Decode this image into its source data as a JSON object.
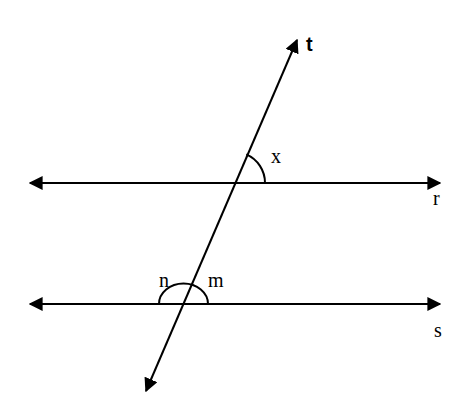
{
  "diagram": {
    "title": "",
    "lines": [
      {
        "id": "r",
        "label": "r",
        "kind": "horizontal",
        "y": 183,
        "x1": 28,
        "x2": 440,
        "arrows": "both"
      },
      {
        "id": "s",
        "label": "s",
        "kind": "horizontal",
        "y": 304,
        "x1": 28,
        "x2": 440,
        "arrows": "both"
      },
      {
        "id": "t",
        "label": "t",
        "kind": "transversal",
        "x1": 298,
        "y1": 38,
        "x2": 145,
        "y2": 392,
        "arrows": "both"
      }
    ],
    "angles": [
      {
        "id": "x",
        "label": "x",
        "at_line": "r",
        "position": "upper-right of intersection of t and r"
      },
      {
        "id": "n",
        "label": "n",
        "at_line": "s",
        "position": "upper-left of intersection of t and s"
      },
      {
        "id": "m",
        "label": "m",
        "at_line": "s",
        "position": "upper-right of intersection of t and s"
      }
    ],
    "labels": {
      "t": "t",
      "r": "r",
      "s": "s",
      "x": "x",
      "n": "n",
      "m": "m"
    },
    "colors": {
      "stroke": "#000000",
      "background": "#ffffff"
    }
  }
}
